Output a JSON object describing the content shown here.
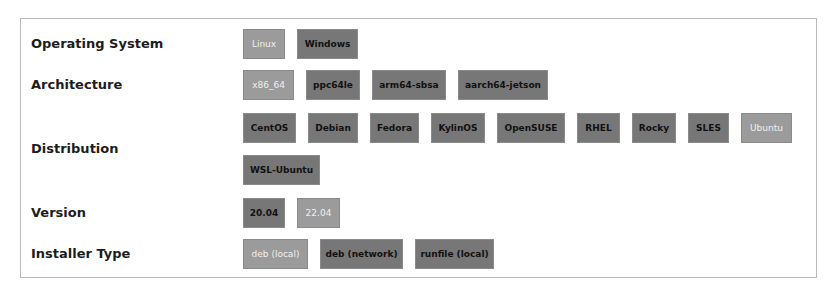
{
  "selector": {
    "rows": [
      {
        "label": "Operating System",
        "options": [
          {
            "label": "Linux",
            "selected": true
          },
          {
            "label": "Windows",
            "selected": false
          }
        ]
      },
      {
        "label": "Architecture",
        "options": [
          {
            "label": "x86_64",
            "selected": true
          },
          {
            "label": "ppc64le",
            "selected": false
          },
          {
            "label": "arm64-sbsa",
            "selected": false
          },
          {
            "label": "aarch64-jetson",
            "selected": false
          }
        ]
      },
      {
        "label": "Distribution",
        "options": [
          {
            "label": "CentOS",
            "selected": false
          },
          {
            "label": "Debian",
            "selected": false
          },
          {
            "label": "Fedora",
            "selected": false
          },
          {
            "label": "KylinOS",
            "selected": false
          },
          {
            "label": "OpenSUSE",
            "selected": false
          },
          {
            "label": "RHEL",
            "selected": false
          },
          {
            "label": "Rocky",
            "selected": false
          },
          {
            "label": "SLES",
            "selected": false
          },
          {
            "label": "Ubuntu",
            "selected": true
          },
          {
            "label": "WSL-Ubuntu",
            "selected": false
          }
        ]
      },
      {
        "label": "Version",
        "options": [
          {
            "label": "20.04",
            "selected": false
          },
          {
            "label": "22.04",
            "selected": true
          }
        ]
      },
      {
        "label": "Installer Type",
        "options": [
          {
            "label": "deb (local)",
            "selected": true
          },
          {
            "label": "deb (network)",
            "selected": false
          },
          {
            "label": "runfile (local)",
            "selected": false
          }
        ]
      }
    ]
  },
  "colors": {
    "selected_bg": "#9b9b9b",
    "unselected_bg": "#777777",
    "border": "#b8b8b8"
  }
}
